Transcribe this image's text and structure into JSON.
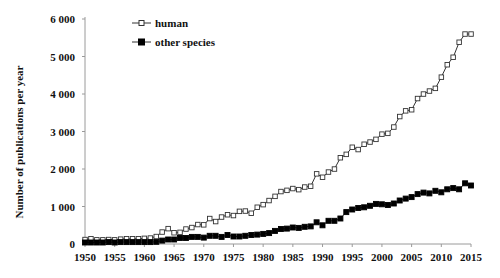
{
  "chart_data": {
    "type": "line",
    "title": "",
    "xlabel": "",
    "ylabel": "Number of publications per year",
    "xlim": [
      1950,
      2015
    ],
    "ylim": [
      0,
      6000
    ],
    "grid": false,
    "legend_position": "top-left",
    "x_ticks": [
      1950,
      1955,
      1960,
      1965,
      1970,
      1975,
      1980,
      1985,
      1990,
      1995,
      2000,
      2005,
      2010,
      2015
    ],
    "x_tick_labels": [
      "1950",
      "1955",
      "1960",
      "1965",
      "1970",
      "1975",
      "1980",
      "1985",
      "1990",
      "1995",
      "2000",
      "2005",
      "2010",
      "2015"
    ],
    "y_ticks": [
      0,
      1000,
      2000,
      3000,
      4000,
      5000,
      6000
    ],
    "y_tick_labels": [
      "0",
      "1 000",
      "2 000",
      "3 000",
      "4 000",
      "5 000",
      "6 000"
    ],
    "x": [
      1950,
      1951,
      1952,
      1953,
      1954,
      1955,
      1956,
      1957,
      1958,
      1959,
      1960,
      1961,
      1962,
      1963,
      1964,
      1965,
      1966,
      1967,
      1968,
      1969,
      1970,
      1971,
      1972,
      1973,
      1974,
      1975,
      1976,
      1977,
      1978,
      1979,
      1980,
      1981,
      1982,
      1983,
      1984,
      1985,
      1986,
      1987,
      1988,
      1989,
      1990,
      1991,
      1992,
      1993,
      1994,
      1995,
      1996,
      1997,
      1998,
      1999,
      2000,
      2001,
      2002,
      2003,
      2004,
      2005,
      2006,
      2007,
      2008,
      2009,
      2010,
      2011,
      2012,
      2013,
      2014,
      2015
    ],
    "series": [
      {
        "name": "human",
        "marker": "open-square",
        "values": [
          120,
          140,
          110,
          110,
          120,
          110,
          130,
          140,
          140,
          140,
          150,
          160,
          200,
          320,
          410,
          300,
          310,
          400,
          440,
          520,
          510,
          680,
          600,
          720,
          780,
          760,
          870,
          880,
          820,
          980,
          1050,
          1160,
          1270,
          1400,
          1430,
          1480,
          1450,
          1520,
          1540,
          1870,
          1780,
          1920,
          2000,
          2300,
          2390,
          2580,
          2520,
          2660,
          2720,
          2790,
          2930,
          2950,
          3120,
          3400,
          3550,
          3580,
          3880,
          4000,
          4080,
          4150,
          4450,
          4780,
          4980,
          5380,
          5600,
          5600
        ]
      },
      {
        "name": "other species",
        "marker": "filled-square",
        "values": [
          40,
          40,
          40,
          40,
          50,
          40,
          50,
          50,
          50,
          50,
          50,
          50,
          60,
          90,
          120,
          120,
          160,
          160,
          190,
          190,
          170,
          220,
          220,
          190,
          240,
          200,
          200,
          220,
          240,
          250,
          270,
          290,
          350,
          400,
          410,
          440,
          430,
          460,
          470,
          580,
          500,
          620,
          620,
          680,
          850,
          920,
          960,
          980,
          1020,
          1070,
          1060,
          1040,
          1080,
          1160,
          1210,
          1250,
          1330,
          1370,
          1350,
          1420,
          1380,
          1460,
          1490,
          1460,
          1620,
          1560
        ]
      }
    ]
  },
  "legend": {
    "items": [
      {
        "label": "human",
        "marker": "open-square"
      },
      {
        "label": "other species",
        "marker": "filled-square"
      }
    ]
  },
  "colors": {
    "line": "#333333",
    "axis": "#9a9a9a",
    "text": "#111111",
    "marker_fill_filled": "#000000",
    "marker_fill_open": "#ffffff"
  }
}
